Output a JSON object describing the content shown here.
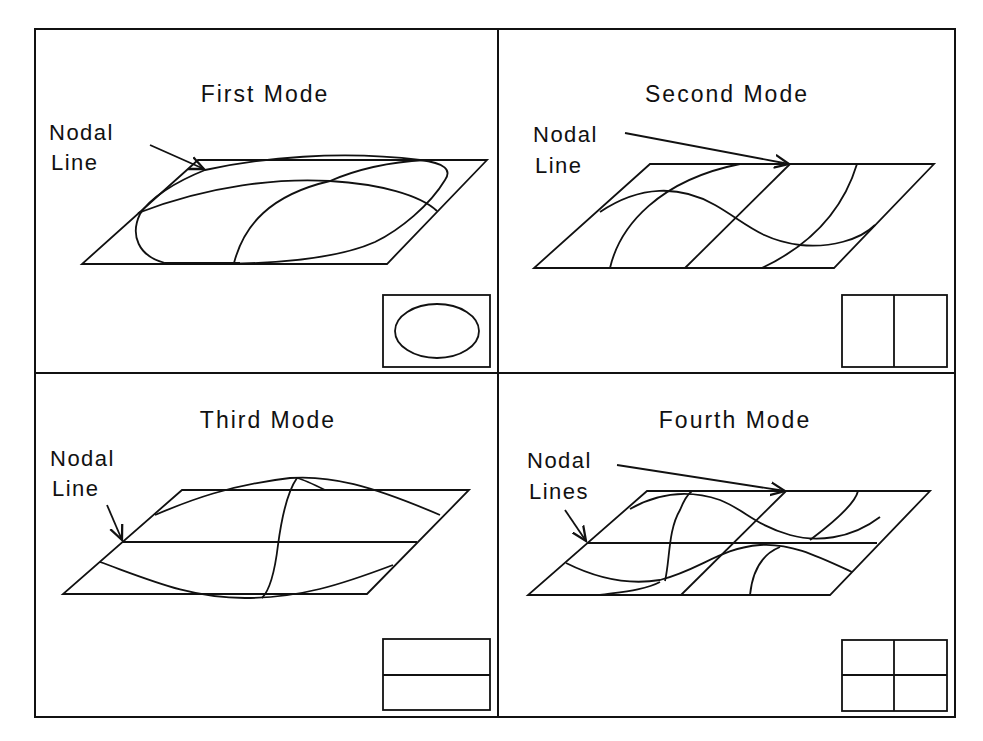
{
  "figure": {
    "top_clipped_text": "pattern in a page of the previous text continuing the description of the figure",
    "panels": [
      {
        "id": "first",
        "title": "First Mode",
        "annotation_line1": "Nodal",
        "annotation_line2": "Line",
        "inset": "ellipse"
      },
      {
        "id": "second",
        "title": "Second Mode",
        "annotation_line1": "Nodal",
        "annotation_line2": "Line",
        "inset": "vertical-split"
      },
      {
        "id": "third",
        "title": "Third Mode",
        "annotation_line1": "Nodal",
        "annotation_line2": "Line",
        "inset": "horizontal-split"
      },
      {
        "id": "fourth",
        "title": "Fourth Mode",
        "annotation_line1": "Nodal",
        "annotation_line2": "Lines",
        "inset": "quad-split"
      }
    ],
    "colors": {
      "line": "#111111",
      "background": "#ffffff"
    }
  }
}
